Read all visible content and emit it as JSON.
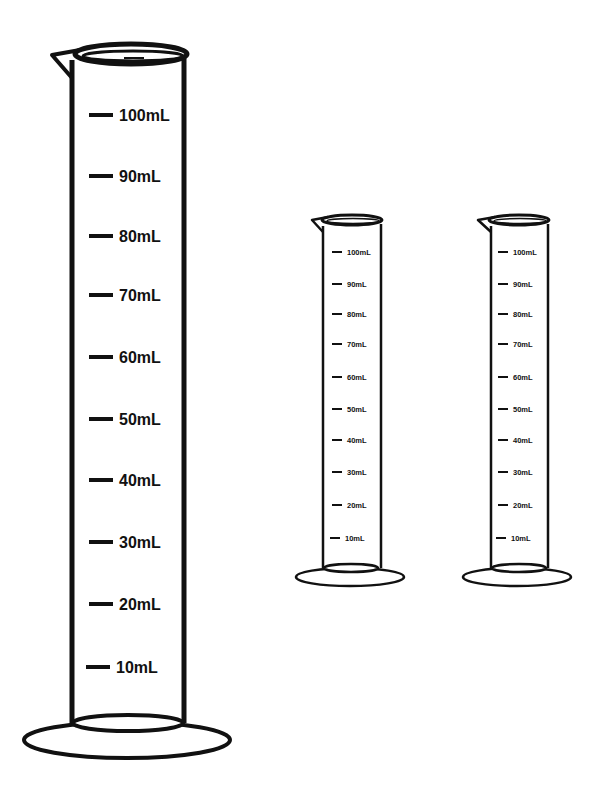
{
  "diagram": {
    "unit": "mL",
    "cylinders": [
      {
        "name": "large-cylinder",
        "graduations": [
          "100mL",
          "90mL",
          "80mL",
          "70mL",
          "60mL",
          "50mL",
          "40mL",
          "30mL",
          "20mL",
          "10mL"
        ]
      },
      {
        "name": "small-cylinder-left",
        "graduations": [
          "100mL",
          "90mL",
          "80mL",
          "70mL",
          "60mL",
          "50mL",
          "40mL",
          "30mL",
          "20mL",
          "10mL"
        ]
      },
      {
        "name": "small-cylinder-right",
        "graduations": [
          "100mL",
          "90mL",
          "80mL",
          "70mL",
          "60mL",
          "50mL",
          "40mL",
          "30mL",
          "20mL",
          "10mL"
        ]
      }
    ],
    "colors": {
      "stroke": "#111111",
      "background": "#ffffff"
    }
  }
}
